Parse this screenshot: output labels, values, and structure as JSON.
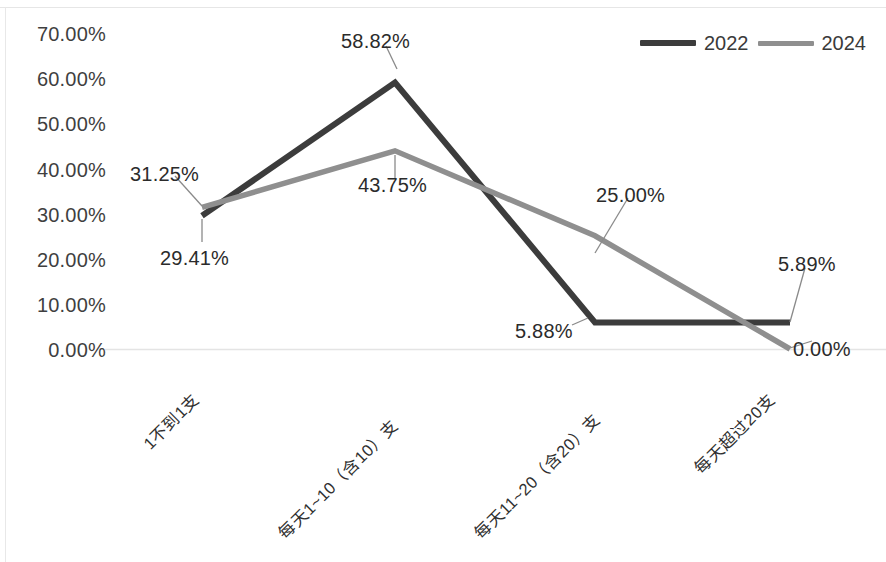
{
  "chart_data": {
    "type": "line",
    "title": "",
    "xlabel": "",
    "ylabel": "",
    "ylim": [
      0,
      70
    ],
    "ytick_format": "percent",
    "grid": "baseline-only",
    "legend_position": "top-right",
    "categories": [
      "1不到1支",
      "每天1~10（含10）支",
      "每天11~20（含20）支",
      "每天超过20支"
    ],
    "yticks": [
      "0.00%",
      "10.00%",
      "20.00%",
      "30.00%",
      "40.00%",
      "50.00%",
      "60.00%",
      "70.00%"
    ],
    "ytick_values": [
      0,
      10,
      20,
      30,
      40,
      50,
      60,
      70
    ],
    "series": [
      {
        "name": "2022",
        "color": "#3c3c3c",
        "values": [
          29.41,
          58.82,
          5.88,
          5.88
        ],
        "labels": [
          "29.41%",
          "58.82%",
          "5.88%",
          ""
        ]
      },
      {
        "name": "2024",
        "color": "#8f8f8f",
        "values": [
          31.25,
          43.75,
          25.0,
          0.0
        ],
        "labels": [
          "31.25%",
          "43.75%",
          "25.00%",
          "0.00%"
        ]
      }
    ],
    "annotations": [
      {
        "text": "31.25%",
        "x": 130,
        "y": 163
      },
      {
        "text": "29.41%",
        "x": 160,
        "y": 247
      },
      {
        "text": "58.82%",
        "x": 341,
        "y": 30
      },
      {
        "text": "43.75%",
        "x": 358,
        "y": 174
      },
      {
        "text": "25.00%",
        "x": 596,
        "y": 184
      },
      {
        "text": "5.88%",
        "x": 515,
        "y": 320
      },
      {
        "text": "5.89%",
        "x": 778,
        "y": 253
      },
      {
        "text": "0.00%",
        "x": 793,
        "y": 338
      }
    ]
  },
  "legend": {
    "items": [
      {
        "label": "2022",
        "color": "#3c3c3c"
      },
      {
        "label": "2024",
        "color": "#8f8f8f"
      }
    ]
  }
}
